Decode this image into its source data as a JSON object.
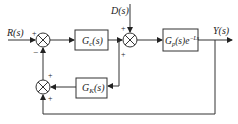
{
  "diagram": {
    "type": "control-system-block-diagram",
    "signals": {
      "input": "R(s)",
      "disturbance": "D(s)",
      "output": "Y(s)"
    },
    "blocks": {
      "controller": {
        "name": "G",
        "sub": "c",
        "arg": "(s)"
      },
      "plant": {
        "name": "G",
        "sub": "p",
        "arg": "(s)e",
        "exp": "−Ls"
      },
      "compensator": {
        "name": "G",
        "sub": "K",
        "arg": "(s)"
      }
    },
    "summers": {
      "s1": {
        "top_sign": "+",
        "bottom_sign": "−"
      },
      "s2": {
        "top_sign": "+",
        "bottom_sign": "+"
      },
      "s3": {
        "top_sign": "+",
        "bottom_sign": "+"
      }
    },
    "colors": {
      "line": "#333333",
      "box": "#333333",
      "background": "#ffffff"
    }
  }
}
